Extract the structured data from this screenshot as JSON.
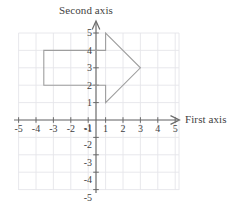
{
  "figure": {
    "kind": "cartesian-coordinate-plane-with-arrow-polygon",
    "axes": {
      "x_axis_title": "First axis",
      "y_axis_title": "Second axis",
      "x_ticks_negative": [
        "-5",
        "-4",
        "-3",
        "-2",
        "-1"
      ],
      "x_ticks_positive": [
        "1",
        "2",
        "3",
        "4",
        "5"
      ],
      "y_ticks_positive": [
        "1",
        "2",
        "3",
        "4",
        "5"
      ],
      "y_ticks_negative": [
        "-1",
        "-2",
        "-3",
        "-4",
        "-5"
      ],
      "x_range": [
        -6,
        6
      ],
      "y_range": [
        -6,
        6
      ],
      "origin_label": ""
    },
    "grid": {
      "visible": true,
      "spacing_units": 1,
      "color": "#e3e3e8"
    },
    "colors": {
      "axis": "#6b6b6b",
      "grid": "#e3e3e8",
      "shape_outline": "#9a9a9a",
      "text": "#3f3f3f",
      "background": "#ffffff"
    },
    "shape": {
      "name": "right-pointing-arrow",
      "fill": "none",
      "stroke": "#9a9a9a",
      "stroke_width": 1,
      "vertices": [
        [
          -3,
          4
        ],
        [
          1,
          4
        ],
        [
          1,
          5
        ],
        [
          3,
          3
        ],
        [
          1,
          2
        ],
        [
          1,
          3
        ],
        [
          -3,
          3
        ]
      ]
    }
  }
}
